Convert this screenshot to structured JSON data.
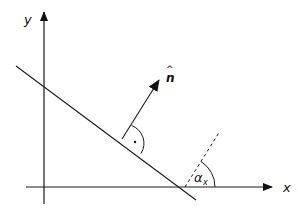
{
  "diagram": {
    "axes": {
      "x_label": "x",
      "y_label": "y"
    },
    "normal_vector": {
      "label": "n",
      "hat": "^"
    },
    "angle": {
      "symbol": "α",
      "subscript": "x"
    },
    "right_angle_marker": "·",
    "colors": {
      "stroke": "#1a1a1a",
      "background": "#ffffff"
    }
  }
}
